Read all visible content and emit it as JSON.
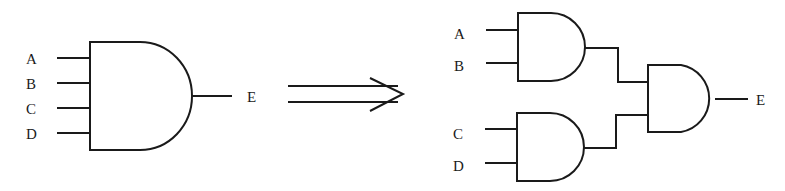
{
  "diagram": {
    "type": "logic-gate-equivalence",
    "left": {
      "gate": "AND",
      "inputs": [
        "A",
        "B",
        "C",
        "D"
      ],
      "output": "E"
    },
    "arrow": {
      "style": "double-line",
      "meaning": "equivalent-to"
    },
    "right": {
      "gates": [
        {
          "id": "and-top",
          "type": "AND",
          "inputs": [
            "A",
            "B"
          ]
        },
        {
          "id": "and-bottom",
          "type": "AND",
          "inputs": [
            "C",
            "D"
          ]
        },
        {
          "id": "and-final",
          "type": "AND",
          "inputs": [
            "and-top",
            "and-bottom"
          ]
        }
      ],
      "inputs": [
        "A",
        "B",
        "C",
        "D"
      ],
      "output": "E"
    }
  },
  "labels": {
    "left_a": "A",
    "left_b": "B",
    "left_c": "C",
    "left_d": "D",
    "left_e": "E",
    "right_a": "A",
    "right_b": "B",
    "right_c": "C",
    "right_d": "D",
    "right_e": "E"
  }
}
